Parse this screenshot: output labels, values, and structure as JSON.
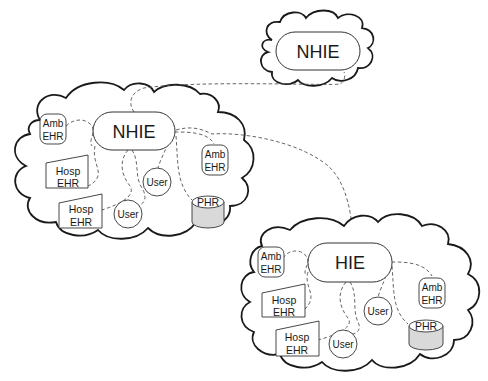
{
  "diagram": {
    "top_cloud": {
      "hub_label": "NHIE"
    },
    "left_cloud": {
      "hub_label": "NHIE",
      "nodes": {
        "amb_ehr_1": {
          "line1": "Amb",
          "line2": "EHR"
        },
        "hosp_ehr_1": {
          "line1": "Hosp",
          "line2": "EHR"
        },
        "hosp_ehr_2": {
          "line1": "Hosp",
          "line2": "EHR"
        },
        "user_1": {
          "label": "User"
        },
        "user_2": {
          "label": "User"
        },
        "amb_ehr_2": {
          "line1": "Amb",
          "line2": "EHR"
        },
        "phr": {
          "label": "PHR"
        }
      }
    },
    "right_cloud": {
      "hub_label": "HIE",
      "nodes": {
        "amb_ehr_1": {
          "line1": "Amb",
          "line2": "EHR"
        },
        "hosp_ehr_1": {
          "line1": "Hosp",
          "line2": "EHR"
        },
        "hosp_ehr_2": {
          "line1": "Hosp",
          "line2": "EHR"
        },
        "user_1": {
          "label": "User"
        },
        "user_2": {
          "label": "User"
        },
        "amb_ehr_2": {
          "line1": "Amb",
          "line2": "EHR"
        },
        "phr": {
          "label": "PHR"
        }
      }
    },
    "colors": {
      "stroke": "#1a1a1a",
      "dashed_link": "#555555",
      "cylinder_fill": "#d9d9d9",
      "background": "#ffffff"
    }
  }
}
